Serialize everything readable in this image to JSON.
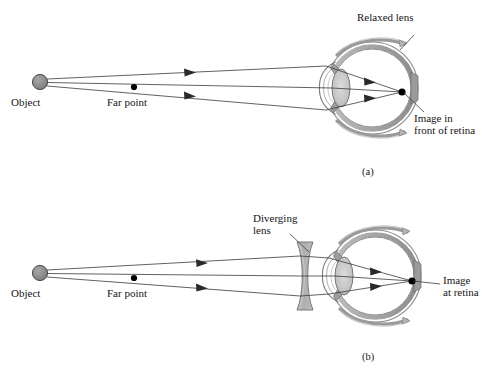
{
  "figure": {
    "title_semantics": "Myopia (nearsightedness) and its correction with a diverging lens",
    "panels": [
      {
        "id": "a",
        "panel_label": "(a)",
        "labels": {
          "object": "Object",
          "far_point": "Far point",
          "lens": "Relaxed lens",
          "image_line1": "Image in",
          "image_line2": "front of retina"
        }
      },
      {
        "id": "b",
        "panel_label": "(b)",
        "labels": {
          "object": "Object",
          "far_point": "Far point",
          "corrective_lens_line1": "Diverging",
          "corrective_lens_line2": "lens",
          "image_line1": "Image",
          "image_line2": "at retina"
        }
      }
    ]
  },
  "colors": {
    "ink": "#151515",
    "ray": "#3a3a3a",
    "object_fill": "#8f8f8f",
    "object_stroke": "#4a4a4a",
    "sclera_stroke": "#707070",
    "retina_band": "#a9a9a9",
    "choroid_band": "#8a8a8a",
    "crystalline_lens_fill": "#c6c6c6",
    "corrective_lens_fill": "#b3b3b3",
    "background": "#ffffff"
  },
  "geometry": {
    "panel_a": {
      "object_point": [
        40,
        82
      ],
      "far_point": [
        134,
        87
      ],
      "eye_center": [
        372,
        88
      ],
      "eye_radius": 46,
      "image_point": [
        402,
        92
      ],
      "note": "image forms in front of the retina"
    },
    "panel_b": {
      "object_point": [
        40,
        273
      ],
      "far_point": [
        134,
        278
      ],
      "corrective_lens_x": 305,
      "eye_center": [
        375,
        276
      ],
      "eye_radius": 46,
      "image_point": [
        412,
        281
      ],
      "note": "image forms on the retina"
    }
  }
}
